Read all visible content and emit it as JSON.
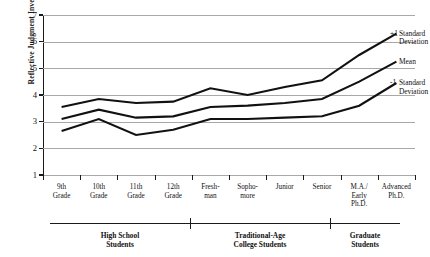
{
  "chart_data": {
    "type": "line",
    "title": "",
    "xlabel": "",
    "ylabel": "Reflective Judgment Inventory Score",
    "ylim": [
      1,
      7
    ],
    "yticks": [
      1,
      2,
      3,
      4,
      5,
      6,
      7
    ],
    "grid": true,
    "legend_position": "right",
    "categories": [
      "9th Grade",
      "10th Grade",
      "11th Grade",
      "12th Grade",
      "Fresh-man",
      "Sopho-more",
      "Junior",
      "Senior",
      "M.A./ Early Ph.D.",
      "Advanced Ph.D."
    ],
    "category_lines": [
      [
        "9th",
        "Grade"
      ],
      [
        "10th",
        "Grade"
      ],
      [
        "11th",
        "Grade"
      ],
      [
        "12th",
        "Grade"
      ],
      [
        "Fresh-",
        "man"
      ],
      [
        "Sopho-",
        "more"
      ],
      [
        "Junior"
      ],
      [
        "Senior"
      ],
      [
        "M.A./",
        "Early",
        "Ph.D."
      ],
      [
        "Advanced",
        "Ph.D."
      ]
    ],
    "series": [
      {
        "name": "+1 Standard Deviation",
        "values": [
          3.55,
          3.85,
          3.7,
          3.75,
          4.25,
          4.0,
          4.3,
          4.55,
          5.5,
          6.3
        ]
      },
      {
        "name": "Mean",
        "values": [
          3.1,
          3.45,
          3.15,
          3.2,
          3.55,
          3.6,
          3.7,
          3.85,
          4.5,
          5.25
        ]
      },
      {
        "name": "-1 Standard Deviation",
        "values": [
          2.65,
          3.1,
          2.5,
          2.7,
          3.1,
          3.1,
          3.15,
          3.2,
          3.6,
          4.45
        ]
      }
    ],
    "groups": [
      {
        "label": "High School Students",
        "lines": [
          "High School",
          "Students"
        ],
        "start": 0,
        "end": 3
      },
      {
        "label": "Traditional-Age College Students",
        "lines": [
          "Traditional-Age",
          "College Students"
        ],
        "start": 4,
        "end": 7
      },
      {
        "label": "Graduate Students",
        "lines": [
          "Graduate",
          "Students"
        ],
        "start": 8,
        "end": 9
      }
    ]
  },
  "legend": {
    "items": [
      {
        "sign": "+1",
        "text_lines": [
          "Standard",
          "Deviation"
        ]
      },
      {
        "sign": "",
        "text_lines": [
          "Mean"
        ]
      },
      {
        "sign": "-1",
        "text_lines": [
          "Standard",
          "Deviation"
        ]
      }
    ]
  },
  "colors": {
    "line": "#111111",
    "grid": "#a8a8a8",
    "axis": "#1a1a1a",
    "background": "#ffffff"
  }
}
